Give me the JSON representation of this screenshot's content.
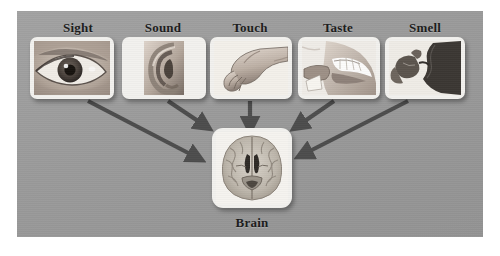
{
  "figure": {
    "title_text": "",
    "panel_background": "#9c9c9c",
    "arrow_color": "#4c4c4c",
    "label_color": "#1b1b1b"
  },
  "senses": [
    {
      "label": "Sight",
      "icon": "eye-photo",
      "image_alt": "close-up photograph of a human eye",
      "label_x": 78,
      "card": {
        "x": 30,
        "y": 37,
        "w": 84,
        "h": 62
      }
    },
    {
      "label": "Sound",
      "icon": "ear-photo",
      "image_alt": "close-up photograph of a human ear",
      "label_x": 163,
      "card": {
        "x": 122,
        "y": 37,
        "w": 84,
        "h": 62
      }
    },
    {
      "label": "Touch",
      "icon": "hands-photo",
      "image_alt": "photograph of two hands touching",
      "label_x": 250,
      "card": {
        "x": 210,
        "y": 37,
        "w": 82,
        "h": 62
      }
    },
    {
      "label": "Taste",
      "icon": "mouth-photo",
      "image_alt": "photograph of a mouth tasting food",
      "label_x": 338,
      "card": {
        "x": 298,
        "y": 37,
        "w": 82,
        "h": 62
      }
    },
    {
      "label": "Smell",
      "icon": "nose-photo",
      "image_alt": "photograph of a nose smelling a flower",
      "label_x": 425,
      "card": {
        "x": 385,
        "y": 37,
        "w": 80,
        "h": 62
      }
    }
  ],
  "target": {
    "label": "Brain",
    "icon": "brain-scan-photo",
    "image_alt": "axial cross-section scan of a human brain",
    "label_x": 252,
    "label_y": 215,
    "card": {
      "x": 212,
      "y": 128,
      "w": 80,
      "h": 80
    }
  },
  "arrows": [
    {
      "name": "arrow-sight-to-brain",
      "from_sense": "Sight",
      "to": "Brain",
      "x1": 88,
      "y1": 101,
      "x2": 198,
      "y2": 158
    },
    {
      "name": "arrow-sound-to-brain",
      "from_sense": "Sound",
      "to": "Brain",
      "x1": 168,
      "y1": 101,
      "x2": 205,
      "y2": 126
    },
    {
      "name": "arrow-touch-to-brain",
      "from_sense": "Touch",
      "to": "Brain",
      "x1": 250,
      "y1": 101,
      "x2": 250,
      "y2": 126
    },
    {
      "name": "arrow-taste-to-brain",
      "from_sense": "Taste",
      "to": "Brain",
      "x1": 334,
      "y1": 101,
      "x2": 298,
      "y2": 126
    },
    {
      "name": "arrow-smell-to-brain",
      "from_sense": "Smell",
      "to": "Brain",
      "x1": 408,
      "y1": 101,
      "x2": 302,
      "y2": 155
    }
  ]
}
